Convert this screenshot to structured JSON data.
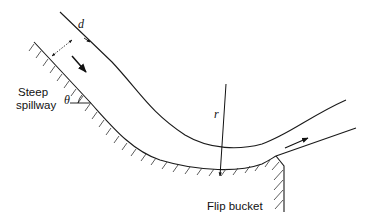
{
  "figure": {
    "labels": {
      "spillway_line1": "Steep",
      "spillway_line2": "spillway",
      "bucket": "Flip bucket",
      "depth": "d",
      "radius": "r",
      "angle": "θ"
    },
    "colors": {
      "stroke": "#1a1a1a",
      "background": "#ffffff"
    }
  }
}
